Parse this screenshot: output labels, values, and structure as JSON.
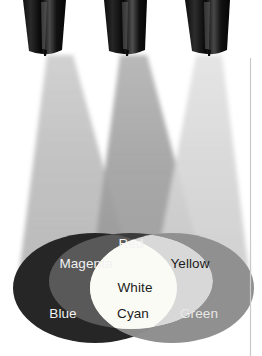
{
  "figure": {
    "background_color": "#ffffff",
    "width": 262,
    "height": 356,
    "rule_color": "#c9c9c9"
  },
  "lamps": [
    {
      "name": "left-lamp",
      "label": "Blue spotlight",
      "body_color": "#0a0a0a",
      "highlight_color": "#5a5a5a"
    },
    {
      "name": "center-lamp",
      "label": "Red spotlight",
      "body_color": "#0a0a0a",
      "highlight_color": "#5a5a5a"
    },
    {
      "name": "right-lamp",
      "label": "Green spotlight",
      "body_color": "#0a0a0a",
      "highlight_color": "#5a5a5a"
    }
  ],
  "beams": [
    {
      "name": "left-beam",
      "color": "#b9b9b9"
    },
    {
      "name": "center-beam",
      "color": "#9a9a9a"
    },
    {
      "name": "right-beam",
      "color": "#d2d2d2"
    }
  ],
  "regions": [
    {
      "name": "blue",
      "label": "Blue",
      "fill": "#262626",
      "text_color": "#f2f2f2"
    },
    {
      "name": "red",
      "label": "Red",
      "fill": "#3b3b3b",
      "text_color": "#f2f2f2"
    },
    {
      "name": "green",
      "label": "Green",
      "fill": "#909090",
      "text_color": "#e8e8e8"
    },
    {
      "name": "magenta",
      "label": "Magenta",
      "fill": "#595959",
      "text_color": "#f2f2f2"
    },
    {
      "name": "cyan",
      "label": "Cyan",
      "fill": "#8b8b8b",
      "text_color": "#1b1b1b"
    },
    {
      "name": "yellow",
      "label": "Yellow",
      "fill": "#d8d8d8",
      "text_color": "#1b1b1b"
    },
    {
      "name": "white",
      "label": "White",
      "fill": "#fbfbf5",
      "text_color": "#1b1b1b"
    }
  ]
}
